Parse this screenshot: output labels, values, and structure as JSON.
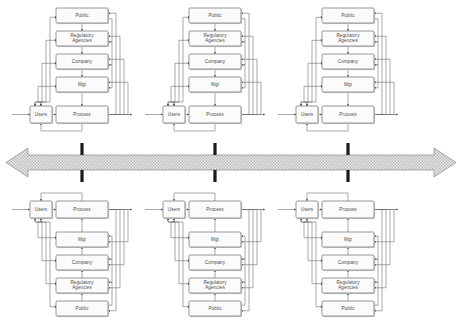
{
  "diagram": {
    "type": "block-flow-diagram",
    "background_color": "#ffffff",
    "node_fill_color": "#fbfbfb",
    "node_stroke_color": "#6b6b6b",
    "wire_color": "#6f6f6f",
    "trunk_color": "#1b1b1b",
    "arrow_fill": "#e3e3e3",
    "label_color": "#4a4a4a",
    "cluster_count": 6,
    "columns": 3,
    "rows": 2,
    "node_labels": {
      "public": "Public",
      "regulatory": "Regulatory\nAgencies",
      "regulatory_line1": "Regulatory",
      "regulatory_line2": "Agencies",
      "company": "Company",
      "mgt": "Mgt",
      "users": "Users",
      "process": "Process"
    },
    "stack_order_top": [
      "Public",
      "Regulatory Agencies",
      "Company",
      "Mgt"
    ],
    "stack_order_bottom": [
      "Mgt",
      "Company",
      "Regulatory Agencies",
      "Public"
    ],
    "base_row": [
      "Users",
      "Process"
    ],
    "central_arrow": {
      "name": "bidirectional-bus-arrow",
      "direction": "both",
      "style": "hatched"
    },
    "clusters": [
      {
        "id": "top-left",
        "orientation": "up",
        "column": 1,
        "row": "top"
      },
      {
        "id": "top-center",
        "orientation": "up",
        "column": 2,
        "row": "top"
      },
      {
        "id": "top-right",
        "orientation": "up",
        "column": 3,
        "row": "top"
      },
      {
        "id": "bottom-left",
        "orientation": "down",
        "column": 1,
        "row": "bottom"
      },
      {
        "id": "bottom-center",
        "orientation": "down",
        "column": 2,
        "row": "bottom"
      },
      {
        "id": "bottom-right",
        "orientation": "down",
        "column": 3,
        "row": "bottom"
      }
    ]
  }
}
